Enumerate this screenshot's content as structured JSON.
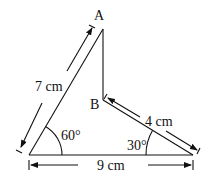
{
  "diagram": {
    "type": "geometry",
    "points": {
      "A": "A",
      "B": "B"
    },
    "dimensions": {
      "left_side": "7 cm",
      "bc_side": "4 cm",
      "base": "9 cm"
    },
    "angles": {
      "bottom_left": "60°",
      "bottom_right": "30°"
    },
    "stroke_color": "#111111",
    "background": "#ffffff"
  }
}
